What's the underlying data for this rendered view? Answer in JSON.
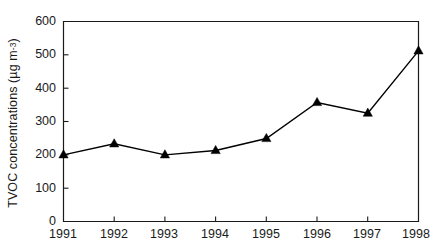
{
  "chart_data": {
    "type": "line",
    "title": "",
    "subtitle": "",
    "xlabel": "",
    "ylabel": "TVOC concentrations (µg m⁻³)",
    "ylabel_main": "TVOC concentrations (µg m",
    "ylabel_exponent": "-3",
    "ylabel_tail": ")",
    "categories": [
      "1991",
      "1992",
      "1993",
      "1994",
      "1995",
      "1996",
      "1997",
      "1998"
    ],
    "x": [
      1991,
      1992,
      1993,
      1994,
      1995,
      1996,
      1997,
      1998
    ],
    "values": [
      200,
      233,
      200,
      213,
      249,
      357,
      325,
      512
    ],
    "series": [
      {
        "name": "TVOC concentrations",
        "values": [
          200,
          233,
          200,
          213,
          249,
          357,
          325,
          512
        ],
        "marker": "filled-triangle",
        "color": "#000000"
      }
    ],
    "ylim": [
      0,
      600
    ],
    "yticks": [
      0,
      100,
      200,
      300,
      400,
      500,
      600
    ],
    "ytick_labels": [
      "0",
      "100",
      "200",
      "300",
      "400",
      "500",
      "600"
    ],
    "xtick_labels": [
      "1991",
      "1992",
      "1993",
      "1994",
      "1995",
      "1996",
      "1997",
      "1998"
    ],
    "grid": false,
    "legend": false,
    "legend_position": "none",
    "background_color": "#ffffff",
    "axis_color": "#1a1a1a",
    "line_color": "#000000",
    "marker_color": "#000000",
    "annotations": []
  }
}
